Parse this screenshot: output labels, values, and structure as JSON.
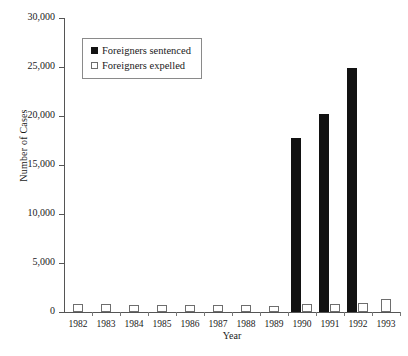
{
  "chart_data": {
    "type": "bar",
    "title": "",
    "xlabel": "Year",
    "ylabel": "Number of Cases",
    "categories": [
      "1982",
      "1983",
      "1984",
      "1985",
      "1986",
      "1987",
      "1988",
      "1989",
      "1990",
      "1991",
      "1992",
      "1993"
    ],
    "series": [
      {
        "name": "Foreigners sentenced",
        "color": "#121212",
        "style": "filled",
        "values": [
          0,
          0,
          0,
          0,
          0,
          0,
          0,
          0,
          17800,
          20200,
          24900,
          0
        ]
      },
      {
        "name": "Foreigners expelled",
        "color": "#ffffff",
        "style": "open",
        "values": [
          800,
          850,
          750,
          750,
          750,
          700,
          700,
          600,
          850,
          800,
          900,
          1300
        ]
      }
    ],
    "ylim": [
      0,
      30000
    ],
    "yticks": [
      0,
      5000,
      10000,
      15000,
      20000,
      25000,
      30000
    ],
    "ytick_labels": [
      "0",
      "5,000",
      "10,000",
      "15,000",
      "20,000",
      "25,000",
      "30,000"
    ],
    "grid": false,
    "legend_position": "top-left-inside"
  },
  "legend": {
    "entries": [
      {
        "label": "Foreigners sentenced"
      },
      {
        "label": "Foreigners expelled"
      }
    ]
  }
}
